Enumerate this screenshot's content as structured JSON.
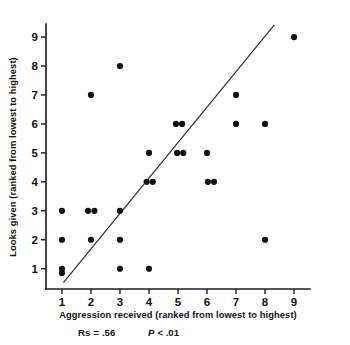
{
  "chart_data": {
    "type": "scatter",
    "title": "",
    "xlabel": "Aggression received (ranked from lowest to highest)",
    "ylabel": "Looks given (ranked from lowest to highest)",
    "xlim": [
      0.45,
      9.55
    ],
    "ylim": [
      0.3,
      9.45
    ],
    "xticks": [
      "1",
      "2",
      "3",
      "4",
      "5",
      "6",
      "7",
      "8",
      "9"
    ],
    "yticks": [
      "1",
      "2",
      "3",
      "4",
      "5",
      "6",
      "7",
      "8",
      "9"
    ],
    "grid": false,
    "legend": "none",
    "point_color": "#111111",
    "line_color": "#2b2b2b",
    "axis_color": "#1a1a1a",
    "points": [
      {
        "x": 1,
        "y": 3
      },
      {
        "x": 1,
        "y": 2
      },
      {
        "x": 1,
        "y": 1
      },
      {
        "x": 1,
        "y": 0.85
      },
      {
        "x": 2,
        "y": 7
      },
      {
        "x": 1.9,
        "y": 3
      },
      {
        "x": 2.12,
        "y": 3
      },
      {
        "x": 2,
        "y": 2
      },
      {
        "x": 3,
        "y": 8
      },
      {
        "x": 3,
        "y": 3
      },
      {
        "x": 3,
        "y": 2
      },
      {
        "x": 3,
        "y": 1
      },
      {
        "x": 4,
        "y": 5
      },
      {
        "x": 3.92,
        "y": 4
      },
      {
        "x": 4.13,
        "y": 4
      },
      {
        "x": 4,
        "y": 1
      },
      {
        "x": 4.93,
        "y": 6
      },
      {
        "x": 5.14,
        "y": 6
      },
      {
        "x": 4.97,
        "y": 5
      },
      {
        "x": 5.18,
        "y": 5
      },
      {
        "x": 6,
        "y": 5
      },
      {
        "x": 6.03,
        "y": 4
      },
      {
        "x": 6.24,
        "y": 4
      },
      {
        "x": 7,
        "y": 7
      },
      {
        "x": 7,
        "y": 6
      },
      {
        "x": 8,
        "y": 6
      },
      {
        "x": 8,
        "y": 2
      },
      {
        "x": 9,
        "y": 9
      }
    ],
    "trend_line": {
      "x1": 1.05,
      "y1": 0.52,
      "x2": 8.32,
      "y2": 9.42
    },
    "annotations": {
      "rs_label": "Rs",
      "rs_equals": "=",
      "rs_value": ".56",
      "p_label": "P",
      "p_value": "< .01"
    }
  }
}
